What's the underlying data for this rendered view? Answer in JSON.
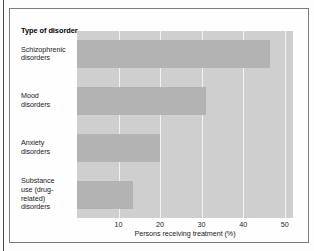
{
  "figure": {
    "category_axis_heading": "Type of disorder"
  },
  "chart_data": {
    "type": "bar",
    "orientation": "horizontal",
    "title": "",
    "subtitle": "",
    "xlabel": "Persons receiving treatment (%)",
    "ylabel": "Type of disorder",
    "categories": [
      "Schizophrenic disorders",
      "Mood disorders",
      "Anxiety disorders",
      "Substance use (drug-related) disorders"
    ],
    "category_lines": [
      [
        "Schizophrenic",
        "disorders"
      ],
      [
        "Mood",
        "disorders"
      ],
      [
        "Anxiety",
        "disorders"
      ],
      [
        "Substance",
        "use (drug-",
        "related)",
        "disorders"
      ]
    ],
    "values": [
      46.5,
      31,
      20,
      13.5
    ],
    "xlim": [
      0,
      52
    ],
    "xticks": [
      10,
      20,
      30,
      40,
      50
    ],
    "xtick_labels": [
      "10",
      "20",
      "30",
      "40",
      "50"
    ],
    "grid": true,
    "grid_axis": "x",
    "legend": false,
    "colors": {
      "bar": "#b3b3b3",
      "plot_background": "#cfcfcf",
      "gridline": "#f2f2f2",
      "text": "#1c1c1c",
      "frame": "#7c7c7c"
    }
  }
}
